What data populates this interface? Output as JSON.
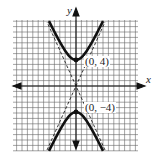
{
  "chart_data": {
    "type": "line",
    "title": "",
    "xlabel": "x",
    "ylabel": "y",
    "grid": true,
    "series": [
      {
        "name": "hyperbola-upper-branch",
        "style": "solid-thick",
        "vertex": [
          0,
          4
        ]
      },
      {
        "name": "hyperbola-lower-branch",
        "style": "solid-thick",
        "vertex": [
          0,
          -4
        ]
      },
      {
        "name": "asymptote-1",
        "style": "dashed"
      },
      {
        "name": "asymptote-2",
        "style": "dashed"
      }
    ],
    "points": [
      {
        "label": "(0, 4)",
        "x": 0,
        "y": 4
      },
      {
        "label": "(0, −4)",
        "x": 0,
        "y": -4
      }
    ]
  },
  "axes": {
    "x_label": "x",
    "y_label": "y"
  },
  "labels": {
    "top_vertex": "(0, 4)",
    "bottom_vertex": "(0, −4)"
  },
  "colors": {
    "grid": "#555555",
    "curve": "#111111",
    "axis": "#111111"
  }
}
